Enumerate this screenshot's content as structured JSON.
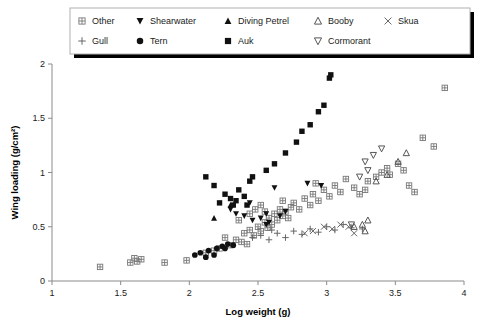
{
  "chart_data": {
    "type": "scatter",
    "title": "",
    "xlabel": "Log weight (g)",
    "ylabel": "Wing loading (g/cm²)",
    "xlim": [
      1,
      4
    ],
    "ylim": [
      0,
      2
    ],
    "xticks": [
      "1",
      "1.5",
      "2",
      "2.5",
      "3",
      "3.5",
      "4"
    ],
    "xtick_values": [
      1,
      1.5,
      2,
      2.5,
      3,
      3.5,
      4
    ],
    "yticks": [
      "0",
      "0.5",
      "1",
      "1.5",
      "2"
    ],
    "ytick_values": [
      0,
      0.5,
      1,
      1.5,
      2
    ],
    "grid": false,
    "legend_position": "top",
    "series": [
      {
        "name": "Other",
        "marker": "crossed-square",
        "points": [
          [
            1.35,
            0.13
          ],
          [
            1.57,
            0.17
          ],
          [
            1.62,
            0.18
          ],
          [
            1.6,
            0.21
          ],
          [
            1.65,
            0.2
          ],
          [
            1.82,
            0.17
          ],
          [
            1.98,
            0.19
          ],
          [
            2.12,
            0.26
          ],
          [
            2.18,
            0.28
          ],
          [
            2.22,
            0.3
          ],
          [
            2.3,
            0.33
          ],
          [
            2.26,
            0.4
          ],
          [
            2.34,
            0.38
          ],
          [
            2.38,
            0.36
          ],
          [
            2.42,
            0.34
          ],
          [
            2.4,
            0.44
          ],
          [
            2.44,
            0.47
          ],
          [
            2.47,
            0.42
          ],
          [
            2.5,
            0.5
          ],
          [
            2.52,
            0.46
          ],
          [
            2.55,
            0.54
          ],
          [
            2.57,
            0.49
          ],
          [
            2.58,
            0.58
          ],
          [
            2.6,
            0.52
          ],
          [
            2.62,
            0.62
          ],
          [
            2.64,
            0.56
          ],
          [
            2.66,
            0.66
          ],
          [
            2.55,
            0.64
          ],
          [
            2.52,
            0.7
          ],
          [
            2.68,
            0.6
          ],
          [
            2.7,
            0.64
          ],
          [
            2.72,
            0.58
          ],
          [
            2.74,
            0.68
          ],
          [
            2.76,
            0.72
          ],
          [
            2.8,
            0.66
          ],
          [
            2.84,
            0.76
          ],
          [
            2.88,
            0.7
          ],
          [
            2.9,
            0.8
          ],
          [
            2.94,
            0.74
          ],
          [
            2.98,
            0.84
          ],
          [
            3.02,
            0.78
          ],
          [
            3.06,
            0.88
          ],
          [
            3.1,
            0.82
          ],
          [
            3.2,
            0.86
          ],
          [
            3.24,
            0.8
          ],
          [
            3.3,
            0.92
          ],
          [
            3.36,
            0.96
          ],
          [
            3.4,
            1.0
          ],
          [
            3.44,
            1.04
          ],
          [
            3.46,
            0.98
          ],
          [
            3.52,
            1.08
          ],
          [
            3.56,
            1.02
          ],
          [
            3.6,
            0.88
          ],
          [
            3.64,
            0.82
          ],
          [
            3.7,
            1.32
          ],
          [
            3.78,
            1.24
          ],
          [
            3.86,
            1.78
          ],
          [
            2.44,
            0.62
          ],
          [
            2.36,
            0.56
          ],
          [
            2.48,
            0.66
          ],
          [
            2.68,
            0.74
          ],
          [
            2.92,
            0.9
          ],
          [
            3.14,
            0.94
          ],
          [
            3.28,
            0.84
          ]
        ]
      },
      {
        "name": "Gull",
        "marker": "plus",
        "points": [
          [
            2.52,
            0.42
          ],
          [
            2.58,
            0.38
          ],
          [
            2.64,
            0.44
          ],
          [
            2.7,
            0.4
          ],
          [
            2.76,
            0.46
          ],
          [
            2.82,
            0.43
          ],
          [
            2.88,
            0.48
          ],
          [
            2.94,
            0.45
          ],
          [
            3.0,
            0.5
          ],
          [
            3.06,
            0.47
          ],
          [
            3.12,
            0.52
          ],
          [
            3.18,
            0.49
          ],
          [
            3.26,
            0.48
          ],
          [
            2.46,
            0.4
          ],
          [
            2.6,
            0.47
          ]
        ]
      },
      {
        "name": "Shearwater",
        "marker": "filled-down-triangle",
        "points": [
          [
            2.34,
            0.62
          ],
          [
            2.46,
            0.56
          ],
          [
            2.52,
            0.58
          ],
          [
            2.56,
            0.62
          ],
          [
            2.58,
            0.54
          ],
          [
            2.66,
            0.6
          ],
          [
            2.7,
            0.64
          ],
          [
            2.44,
            0.72
          ],
          [
            2.3,
            0.66
          ],
          [
            2.62,
            0.86
          ],
          [
            2.86,
            0.9
          ],
          [
            2.96,
            0.88
          ],
          [
            2.56,
            0.52
          ],
          [
            2.4,
            0.6
          ]
        ]
      },
      {
        "name": "Tern",
        "marker": "filled-circle",
        "points": [
          [
            2.04,
            0.24
          ],
          [
            2.08,
            0.26
          ],
          [
            2.14,
            0.28
          ],
          [
            2.2,
            0.3
          ],
          [
            2.24,
            0.32
          ],
          [
            2.28,
            0.34
          ],
          [
            2.32,
            0.33
          ],
          [
            2.18,
            0.24
          ],
          [
            2.12,
            0.22
          ],
          [
            2.26,
            0.3
          ]
        ]
      },
      {
        "name": "Diving Petrel",
        "marker": "filled-up-triangle",
        "points": [
          [
            2.18,
            0.58
          ],
          [
            2.3,
            0.7
          ]
        ]
      },
      {
        "name": "Auk",
        "marker": "filled-square",
        "points": [
          [
            2.22,
            0.72
          ],
          [
            2.26,
            0.8
          ],
          [
            2.3,
            0.76
          ],
          [
            2.32,
            0.7
          ],
          [
            2.36,
            0.84
          ],
          [
            2.4,
            0.78
          ],
          [
            2.44,
            0.92
          ],
          [
            2.18,
            0.88
          ],
          [
            2.34,
            0.74
          ],
          [
            2.42,
            0.7
          ],
          [
            2.56,
            1.02
          ],
          [
            2.62,
            1.08
          ],
          [
            2.7,
            1.18
          ],
          [
            2.78,
            1.28
          ],
          [
            2.82,
            1.38
          ],
          [
            2.88,
            1.44
          ],
          [
            2.94,
            1.56
          ],
          [
            2.98,
            1.62
          ],
          [
            3.02,
            1.87
          ],
          [
            3.03,
            1.9
          ],
          [
            2.46,
            0.96
          ],
          [
            2.12,
            0.96
          ]
        ]
      },
      {
        "name": "Booby",
        "marker": "open-up-triangle",
        "points": [
          [
            3.2,
            0.5
          ],
          [
            3.26,
            0.52
          ],
          [
            3.3,
            0.56
          ],
          [
            3.36,
            0.92
          ],
          [
            3.44,
            0.98
          ],
          [
            3.52,
            1.1
          ],
          [
            3.58,
            1.18
          ],
          [
            3.28,
            0.46
          ]
        ]
      },
      {
        "name": "Cormorant",
        "marker": "open-down-triangle",
        "points": [
          [
            3.18,
            0.52
          ],
          [
            3.28,
            1.1
          ],
          [
            3.34,
            1.16
          ],
          [
            3.3,
            1.02
          ],
          [
            3.4,
            1.22
          ],
          [
            3.24,
            0.96
          ]
        ]
      },
      {
        "name": "Skua",
        "marker": "cross-x",
        "points": [
          [
            2.9,
            0.46
          ],
          [
            2.98,
            0.5
          ],
          [
            3.04,
            0.48
          ],
          [
            3.1,
            0.52
          ],
          [
            3.16,
            0.5
          ],
          [
            3.2,
            0.44
          ],
          [
            2.84,
            0.44
          ]
        ]
      }
    ]
  },
  "legend": {
    "row1": [
      {
        "label": "Other",
        "marker": "crossed-square"
      },
      {
        "label": "Shearwater",
        "marker": "filled-down-triangle"
      },
      {
        "label": "Diving Petrel",
        "marker": "filled-up-triangle"
      },
      {
        "label": "Booby",
        "marker": "open-up-triangle"
      },
      {
        "label": "Skua",
        "marker": "cross-x"
      }
    ],
    "row2": [
      {
        "label": "Gull",
        "marker": "plus"
      },
      {
        "label": "Tern",
        "marker": "filled-circle"
      },
      {
        "label": "Auk",
        "marker": "filled-square"
      },
      {
        "label": "Cormorant",
        "marker": "open-down-triangle"
      }
    ]
  },
  "colors": {
    "marker_fill": "#111111",
    "marker_open": "#555555",
    "axis": "#8a8a8a",
    "text": "#1a1a1a",
    "background": "#ffffff"
  }
}
